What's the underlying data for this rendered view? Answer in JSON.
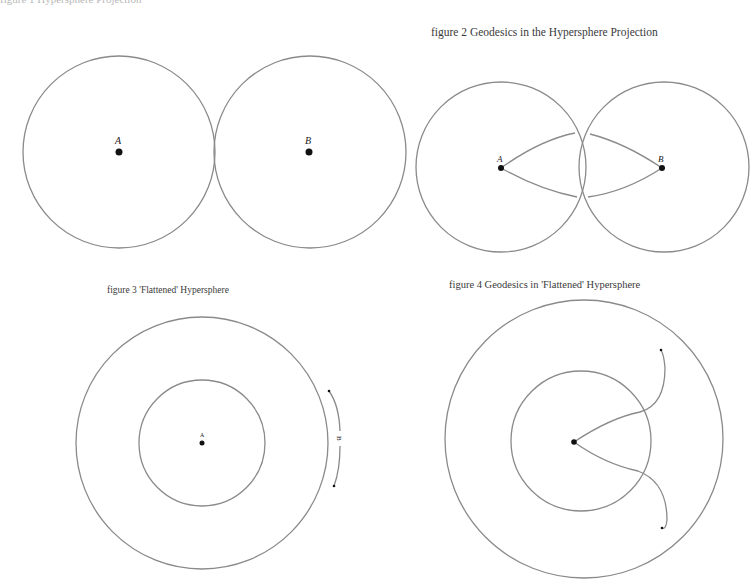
{
  "figures": {
    "fig1": {
      "caption": "figure 1  Hypersphere Projection",
      "point_a": "A",
      "point_b": "B"
    },
    "fig2": {
      "caption": "figure 2  Geodesics in the Hypersphere Projection",
      "point_a": "A",
      "point_b": "B"
    },
    "fig3": {
      "caption": "figure 3  'Flattened' Hypersphere",
      "point_a": "A",
      "point_b": "B"
    },
    "fig4": {
      "caption": "figure 4  Geodesics in 'Flattened' Hypersphere"
    }
  },
  "colors": {
    "line": "#8a8a8a",
    "point": "#111111",
    "text": "#3a3a3a"
  }
}
